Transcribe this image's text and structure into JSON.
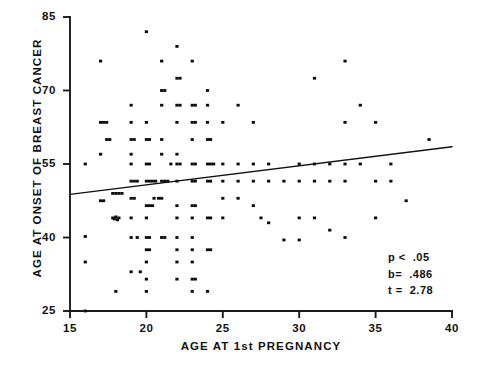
{
  "chart_data": {
    "type": "scatter",
    "title": "",
    "xlabel": "AGE AT 1st PREGNANCY",
    "ylabel": "AGE AT ONSET OF BREAST CANCER",
    "xlim": [
      15,
      40
    ],
    "ylim": [
      25,
      85
    ],
    "xticks": [
      15,
      20,
      25,
      30,
      35,
      40
    ],
    "xtick_labels": [
      "15",
      "20",
      "25",
      "30",
      "35",
      "40"
    ],
    "yticks": [
      25,
      40,
      55,
      70,
      85
    ],
    "ytick_labels": [
      "25",
      "40",
      "55",
      "70",
      "85"
    ],
    "grid": false,
    "legend": null,
    "marker": "square-dot",
    "marker_color": "#0d0d0d",
    "line_color": "#111111",
    "axis_color": "#1a1a1a",
    "annotations": [
      {
        "name": "p-value",
        "text": "p <  .05"
      },
      {
        "name": "slope",
        "text": "b=  .486"
      },
      {
        "name": "t-statistic",
        "text": "t =  2.78"
      }
    ],
    "regression_line": {
      "x_start": 15,
      "y_start": 48.8,
      "x_end": 40,
      "y_end": 58.5,
      "slope": 0.486,
      "t": 2.78,
      "p": "< .05"
    },
    "points": [
      [
        16.0,
        55.0
      ],
      [
        16.0,
        40.2
      ],
      [
        16.0,
        35.0
      ],
      [
        16.0,
        25.0
      ],
      [
        17.0,
        76.0
      ],
      [
        17.0,
        63.5
      ],
      [
        17.2,
        63.5
      ],
      [
        17.4,
        63.5
      ],
      [
        17.0,
        57.0
      ],
      [
        17.4,
        60.0
      ],
      [
        17.6,
        60.0
      ],
      [
        17.0,
        47.5
      ],
      [
        17.2,
        47.5
      ],
      [
        17.8,
        44.0
      ],
      [
        18.0,
        44.2
      ],
      [
        18.2,
        44.0
      ],
      [
        17.9,
        43.8
      ],
      [
        18.1,
        43.6
      ],
      [
        17.8,
        49.0
      ],
      [
        18.0,
        49.0
      ],
      [
        18.2,
        49.0
      ],
      [
        18.4,
        49.0
      ],
      [
        18.0,
        29.0
      ],
      [
        19.0,
        67.0
      ],
      [
        19.0,
        63.5
      ],
      [
        19.0,
        60.0
      ],
      [
        19.2,
        60.0
      ],
      [
        19.0,
        57.0
      ],
      [
        19.0,
        55.0
      ],
      [
        19.0,
        51.5
      ],
      [
        19.2,
        51.5
      ],
      [
        19.4,
        51.5
      ],
      [
        19.0,
        48.0
      ],
      [
        19.2,
        48.0
      ],
      [
        19.0,
        44.0
      ],
      [
        19.0,
        40.0
      ],
      [
        19.4,
        40.0
      ],
      [
        19.0,
        33.0
      ],
      [
        19.6,
        33.0
      ],
      [
        20.0,
        82.0
      ],
      [
        20.0,
        63.5
      ],
      [
        20.0,
        60.0
      ],
      [
        20.2,
        60.0
      ],
      [
        20.0,
        55.0
      ],
      [
        20.2,
        55.0
      ],
      [
        20.0,
        51.5
      ],
      [
        20.2,
        51.5
      ],
      [
        20.4,
        51.5
      ],
      [
        20.6,
        51.5
      ],
      [
        20.0,
        46.5
      ],
      [
        20.2,
        46.5
      ],
      [
        20.4,
        46.5
      ],
      [
        20.0,
        44.0
      ],
      [
        20.0,
        40.0
      ],
      [
        20.2,
        40.0
      ],
      [
        20.0,
        37.5
      ],
      [
        20.2,
        37.5
      ],
      [
        20.0,
        35.0
      ],
      [
        20.0,
        31.5
      ],
      [
        20.0,
        29.0
      ],
      [
        20.5,
        48.0
      ],
      [
        20.8,
        48.0
      ],
      [
        21.0,
        76.0
      ],
      [
        21.0,
        70.0
      ],
      [
        21.2,
        70.0
      ],
      [
        21.0,
        67.0
      ],
      [
        21.0,
        60.0
      ],
      [
        21.0,
        57.0
      ],
      [
        21.0,
        51.5
      ],
      [
        21.2,
        51.5
      ],
      [
        21.4,
        51.5
      ],
      [
        21.0,
        48.0
      ],
      [
        21.0,
        40.0
      ],
      [
        21.2,
        40.0
      ],
      [
        21.6,
        55.0
      ],
      [
        22.0,
        79.0
      ],
      [
        22.0,
        72.5
      ],
      [
        22.2,
        72.5
      ],
      [
        22.0,
        67.0
      ],
      [
        22.2,
        67.0
      ],
      [
        22.0,
        63.5
      ],
      [
        22.0,
        57.0
      ],
      [
        22.0,
        55.0
      ],
      [
        22.2,
        55.0
      ],
      [
        22.0,
        51.5
      ],
      [
        22.0,
        46.5
      ],
      [
        22.0,
        44.0
      ],
      [
        22.0,
        40.0
      ],
      [
        22.0,
        37.5
      ],
      [
        22.0,
        35.0
      ],
      [
        22.0,
        31.5
      ],
      [
        23.0,
        76.0
      ],
      [
        23.0,
        67.0
      ],
      [
        23.2,
        67.0
      ],
      [
        23.0,
        63.5
      ],
      [
        23.2,
        63.5
      ],
      [
        23.0,
        60.0
      ],
      [
        23.0,
        55.0
      ],
      [
        23.2,
        55.0
      ],
      [
        23.0,
        51.5
      ],
      [
        23.2,
        51.5
      ],
      [
        23.0,
        46.5
      ],
      [
        23.2,
        46.5
      ],
      [
        23.0,
        44.0
      ],
      [
        23.0,
        40.0
      ],
      [
        23.0,
        37.5
      ],
      [
        23.0,
        35.0
      ],
      [
        23.0,
        31.5
      ],
      [
        23.2,
        31.5
      ],
      [
        23.0,
        29.0
      ],
      [
        24.0,
        70.0
      ],
      [
        24.0,
        67.0
      ],
      [
        24.0,
        63.5
      ],
      [
        24.0,
        60.0
      ],
      [
        24.2,
        60.0
      ],
      [
        24.0,
        55.0
      ],
      [
        24.2,
        55.0
      ],
      [
        24.4,
        55.0
      ],
      [
        24.0,
        51.5
      ],
      [
        24.2,
        51.5
      ],
      [
        24.0,
        44.0
      ],
      [
        24.2,
        44.0
      ],
      [
        24.0,
        37.5
      ],
      [
        24.2,
        37.5
      ],
      [
        24.0,
        29.0
      ],
      [
        25.0,
        63.5
      ],
      [
        25.0,
        55.0
      ],
      [
        25.0,
        51.5
      ],
      [
        25.0,
        48.0
      ],
      [
        25.0,
        44.0
      ],
      [
        26.0,
        67.0
      ],
      [
        26.0,
        55.0
      ],
      [
        26.0,
        51.5
      ],
      [
        26.0,
        48.0
      ],
      [
        27.0,
        63.5
      ],
      [
        27.0,
        55.0
      ],
      [
        27.0,
        51.5
      ],
      [
        27.0,
        46.5
      ],
      [
        27.5,
        44.0
      ],
      [
        28.0,
        55.0
      ],
      [
        28.0,
        51.5
      ],
      [
        28.0,
        43.0
      ],
      [
        29.0,
        51.5
      ],
      [
        29.0,
        39.5
      ],
      [
        30.0,
        55.0
      ],
      [
        30.0,
        51.5
      ],
      [
        30.0,
        44.0
      ],
      [
        30.0,
        39.5
      ],
      [
        31.0,
        72.5
      ],
      [
        31.0,
        55.0
      ],
      [
        31.0,
        51.5
      ],
      [
        31.0,
        44.0
      ],
      [
        32.0,
        55.0
      ],
      [
        32.0,
        51.5
      ],
      [
        32.0,
        41.5
      ],
      [
        33.0,
        76.0
      ],
      [
        33.0,
        63.5
      ],
      [
        33.0,
        55.0
      ],
      [
        33.0,
        51.5
      ],
      [
        33.0,
        40.0
      ],
      [
        34.0,
        67.0
      ],
      [
        34.0,
        55.0
      ],
      [
        35.0,
        63.5
      ],
      [
        35.0,
        51.5
      ],
      [
        35.0,
        44.0
      ],
      [
        36.0,
        55.0
      ],
      [
        36.0,
        51.5
      ],
      [
        37.0,
        47.5
      ],
      [
        38.5,
        60.0
      ]
    ]
  },
  "axes": {
    "x_start_px": 70,
    "x_end_px": 452,
    "y_top_px": 17,
    "y_bottom_px": 311
  }
}
